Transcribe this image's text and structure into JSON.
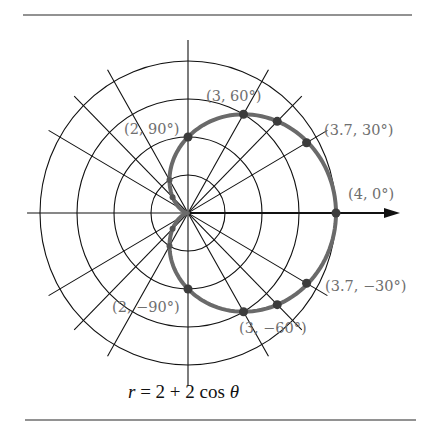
{
  "chart_data": {
    "type": "line",
    "subtype": "polar",
    "title": "r = 2 + 2 cos θ",
    "equation": {
      "r": "r",
      "eq": " = 2 + 2 cos ",
      "theta": "θ"
    },
    "polar_grid": {
      "radii": [
        1,
        2,
        3,
        4
      ],
      "ray_angles_deg": [
        0,
        30,
        45,
        60,
        90,
        120,
        135,
        150
      ],
      "polar_axis_arrow": true
    },
    "curve": {
      "formula": "2 + 2*cos(theta)",
      "theta_range_deg": [
        0,
        360
      ],
      "color": "#6a6a6a"
    },
    "labeled_points": [
      {
        "r": 4,
        "theta": 0,
        "label": "(4, 0°)"
      },
      {
        "r": 3.7,
        "theta": 30,
        "label": "(3.7, 30°)"
      },
      {
        "r": 3,
        "theta": 60,
        "label": "(3, 60°)"
      },
      {
        "r": 2,
        "theta": 90,
        "label": "(2, 90°)"
      },
      {
        "r": 2,
        "theta": -90,
        "label": "(2, −90°)"
      },
      {
        "r": 3,
        "theta": -60,
        "label": "(3, −60°)"
      },
      {
        "r": 3.7,
        "theta": -30,
        "label": "(3.7, −30°)"
      }
    ],
    "unlabeled_points": [
      {
        "r": 3.41,
        "theta": 45
      },
      {
        "r": 3.41,
        "theta": -45
      },
      {
        "r": 1,
        "theta": 120
      },
      {
        "r": 1,
        "theta": -120
      },
      {
        "r": 0.59,
        "theta": 135
      },
      {
        "r": 0.59,
        "theta": -135
      }
    ],
    "xlabel": "",
    "ylabel": "",
    "grid": true,
    "legend": "none"
  },
  "labels": {
    "p0": "(4, 0°)",
    "p30": "(3.7, 30°)",
    "p60": "(3, 60°)",
    "p90": "(2, 90°)",
    "pm90": "(2, −90°)",
    "pm60": "(3, −60°)",
    "pm30": "(3.7, −30°)"
  }
}
